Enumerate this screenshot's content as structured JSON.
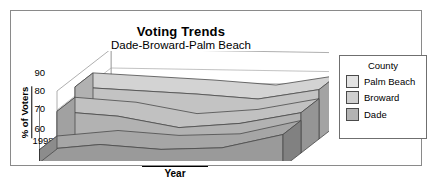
{
  "chart_data": {
    "type": "area",
    "title": "Voting Trends",
    "subtitle": "Dade-Broward-Palm Beach",
    "xlabel": "Year",
    "ylabel": "% of Voters",
    "categories": [
      "1998",
      "1999",
      "2000",
      "2001",
      "2002"
    ],
    "ylim": [
      60,
      100
    ],
    "yticks": [
      "60",
      "70",
      "80",
      "90"
    ],
    "grid": true,
    "legend_position": "right",
    "legend_title": "County",
    "series": [
      {
        "name": "Palm Beach",
        "values": [
          97,
          95,
          93,
          90,
          98
        ],
        "color": "#e3e3e3"
      },
      {
        "name": "Broward",
        "values": [
          89,
          86,
          78,
          82,
          91
        ],
        "color": "#cfcfcf"
      },
      {
        "name": "Dade",
        "values": [
          70,
          75,
          72,
          74,
          85
        ],
        "color": "#b3b3b3"
      }
    ]
  },
  "legend": {
    "title": "County",
    "items": [
      {
        "label": "Palm Beach"
      },
      {
        "label": "Broward"
      },
      {
        "label": "Dade"
      }
    ]
  },
  "axes": {
    "y_ticks": [
      "90",
      "80",
      "70",
      "60"
    ],
    "x_ticks": [
      "1998",
      "1999",
      "2000",
      "2001",
      "2002"
    ],
    "y_title": "% of Voters",
    "x_title": "Year"
  }
}
